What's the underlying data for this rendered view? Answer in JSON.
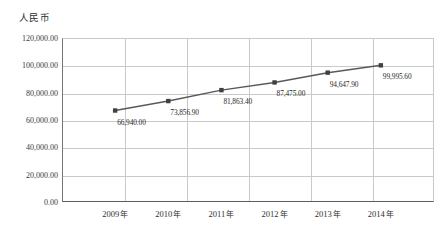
{
  "chart_data": {
    "type": "line",
    "title": "",
    "xlabel": "",
    "ylabel": "人民币",
    "categories": [
      "2009 年",
      "2010 年",
      "2011 年",
      "2012 年",
      "2013 年",
      "2014 年"
    ],
    "values": [
      66940.0,
      73856.9,
      81863.4,
      87475.0,
      94647.9,
      99995.6
    ],
    "point_labels": [
      "66,940.00",
      "73,856.90",
      "81,863.40",
      "87,475.00",
      "94,647.90",
      "99,995.60"
    ],
    "ylim": [
      0,
      120000
    ],
    "ytick_values": [
      0,
      20000,
      40000,
      60000,
      80000,
      100000,
      120000
    ],
    "ytick_labels": [
      "0.00",
      "20,000.00",
      "40,000.00",
      "60,000.00",
      "80,000.00",
      "100,000.00",
      "120,000.00"
    ],
    "grid": true,
    "legend": "none",
    "series": [
      {
        "name": "人民币",
        "color": "#595959",
        "marker": "square",
        "values": [
          66940.0,
          73856.9,
          81863.4,
          87475.0,
          94647.9,
          99995.6
        ]
      }
    ],
    "colors": {
      "line": "#595959",
      "marker": "#404040",
      "grid": "#c9c9c9",
      "axis": "#5e5e5e",
      "text": "#2f2f2f"
    }
  },
  "axis": {
    "y_title": "人民币"
  },
  "header": {
    "title": ""
  }
}
